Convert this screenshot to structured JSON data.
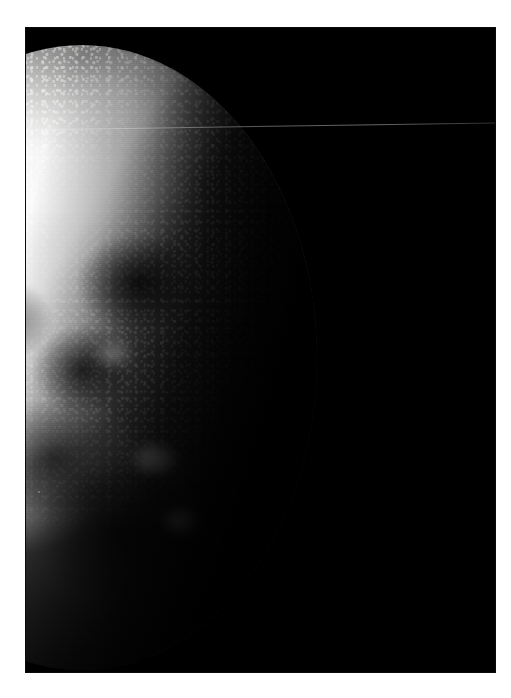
{
  "image": {
    "subject": "Earth",
    "view": "crescent-lit planetary disc photographed from space",
    "orientation": "portrait",
    "caption": "",
    "frame": {
      "page_background": "#ffffff",
      "plate_background": "#000000",
      "plate_left": 25,
      "plate_top": 27,
      "plate_width": 471,
      "plate_height": 646,
      "border_style": "white photographic margin"
    },
    "palette": {
      "space_black": "#000000",
      "cloud_white": "#ffffff",
      "highlight_grey": "#e2e2e0",
      "midtone_grey": "#7e7e7e",
      "shadow_grey": "#272727",
      "terminator_black": "#030303",
      "artifact_grey": "#9a9a9a",
      "page_white": "#ffffff"
    },
    "features": [
      {
        "name": "sunlit-limb",
        "label": "Bright sunlit limb arcing across the upper-left of the disc"
      },
      {
        "name": "cloud-deck",
        "label": "Broad illuminated cloud deck over the day hemisphere"
      },
      {
        "name": "frontal-cloud-band",
        "label": "Diagonal frontal cloud band sweeping toward the lower left"
      },
      {
        "name": "cellular-clouds",
        "label": "Mottled cellular cumulus field near the terminator"
      },
      {
        "name": "storm-cluster",
        "label": "Bright convective storm cluster low on the lit disc"
      },
      {
        "name": "dark-ocean",
        "label": "Dark cloud-free ocean and shadowed regions"
      },
      {
        "name": "terminator",
        "label": "Day-night terminator running from upper right to lower left"
      },
      {
        "name": "night-side",
        "label": "Unlit night hemisphere fading into black space"
      },
      {
        "name": "space-field",
        "label": "Black empty space filling the right of the frame"
      },
      {
        "name": "scan-line-artifact",
        "label": "Faint near-horizontal scan-line streak across the plate"
      },
      {
        "name": "dust-speck",
        "label": "Small dust speck on the print at the lower left"
      }
    ]
  }
}
